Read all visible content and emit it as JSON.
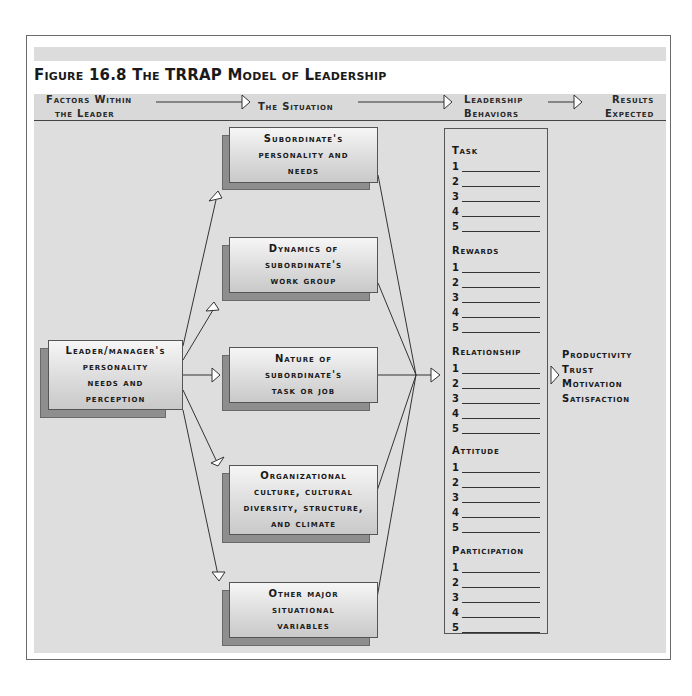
{
  "figure": {
    "title": "Figure 16.8   The TRRAP Model of Leadership"
  },
  "header": {
    "stages": [
      {
        "line1": "Factors Within",
        "line2": "the Leader"
      },
      {
        "line1": "The Situation"
      },
      {
        "line1": "Leadership",
        "line2": "Behaviors"
      },
      {
        "line1": "Results",
        "line2": "Expected"
      }
    ]
  },
  "leader_box": {
    "lines": [
      "Leader/manager's",
      "personality",
      "needs and",
      "perception"
    ]
  },
  "situation_boxes": [
    {
      "lines": [
        "Subordinate's",
        "personality and",
        "needs"
      ]
    },
    {
      "lines": [
        "Dynamics of",
        "subordinate's",
        "work group"
      ]
    },
    {
      "lines": [
        "Nature of",
        "subordinate's",
        "task or job"
      ]
    },
    {
      "lines": [
        "Organizational",
        "culture, cultural",
        "diversity, structure,",
        "and climate"
      ]
    },
    {
      "lines": [
        "Other major",
        "situational",
        "variables"
      ]
    }
  ],
  "behaviors": {
    "categories": [
      {
        "label": "Task",
        "items": [
          "1",
          "2",
          "3",
          "4",
          "5"
        ]
      },
      {
        "label": "Rewards",
        "items": [
          "1",
          "2",
          "3",
          "4",
          "5"
        ]
      },
      {
        "label": "Relationship",
        "items": [
          "1",
          "2",
          "3",
          "4",
          "5"
        ]
      },
      {
        "label": "Attitude",
        "items": [
          "1",
          "2",
          "3",
          "4",
          "5"
        ]
      },
      {
        "label": "Participation",
        "items": [
          "1",
          "2",
          "3",
          "4",
          "5"
        ]
      }
    ]
  },
  "results": {
    "items": [
      "Productivity",
      "Trust",
      "Motivation",
      "Satisfaction"
    ]
  },
  "colors": {
    "band": "#dedede",
    "box_shadow": "#8e8e8e",
    "line": "#333333"
  }
}
